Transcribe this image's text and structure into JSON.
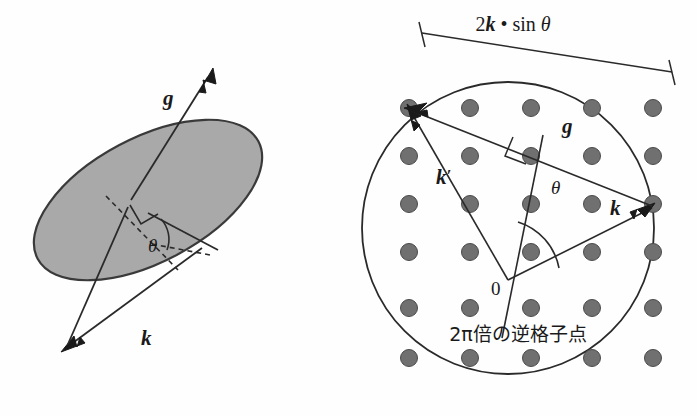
{
  "figure": {
    "background_color": "#fefefe",
    "line_color": "#2a2a2a",
    "lattice_dot_fill": "#707070",
    "plane_fill": "#a9a9a9",
    "plane_stroke": "#3a3a3a"
  },
  "left_panel": {
    "name": "lattice-plane-diagram",
    "labels": {
      "g_vector": "g",
      "k_vector": "k",
      "theta": "θ"
    },
    "elements": {
      "plane_shape": "ellipse",
      "right_angle_marker": true,
      "dashed_reference_line": true,
      "theta_arc": true
    }
  },
  "right_panel": {
    "name": "ewald-sphere-diagram",
    "labels": {
      "dimension": "2k • sin θ",
      "g_vector": "g",
      "k_vector": "k",
      "k_prime_vector": "k′",
      "theta": "θ",
      "origin": "0",
      "caption_jp": "2π倍の逆格子点"
    },
    "elements": {
      "circle": true,
      "right_angle_marker": true,
      "theta_arc": true,
      "dimension_line_ticks": 2,
      "lattice_rows": 6,
      "lattice_cols": 5,
      "lattice_spacing_x": 61,
      "lattice_spacing_y": 48
    }
  }
}
